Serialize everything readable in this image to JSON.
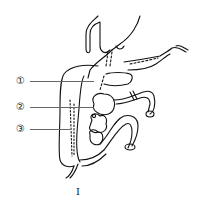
{
  "figure": {
    "caption": "I",
    "labels": [
      {
        "id": 1,
        "text": "①"
      },
      {
        "id": 2,
        "text": "②"
      },
      {
        "id": 3,
        "text": "③"
      }
    ]
  }
}
